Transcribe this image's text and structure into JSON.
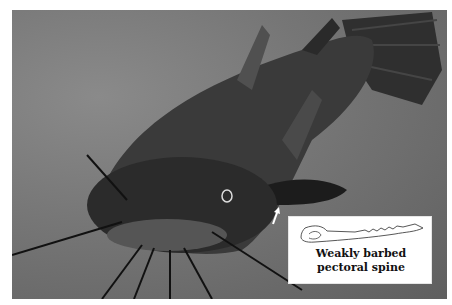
{
  "figure": {
    "photo_tone": "grayscale",
    "background_color": "#777777"
  },
  "inset": {
    "caption_line1": "Weakly barbed",
    "caption_line2": "pectoral spine",
    "drawing": "pectoral-spine-outline"
  },
  "annotation": {
    "pointer": "white-arrow-to-pectoral-fin"
  }
}
